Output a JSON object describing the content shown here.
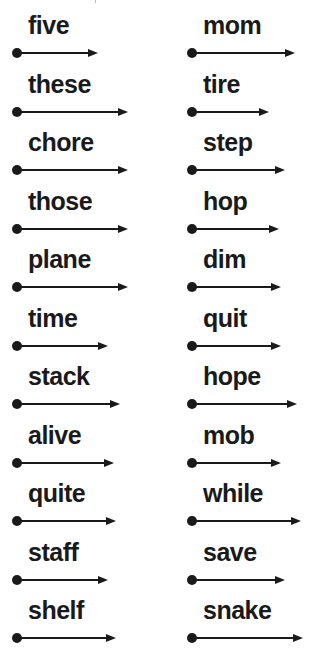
{
  "page": {
    "background": "#ffffff",
    "ink": "#1a1a1a"
  },
  "columns": [
    {
      "x": 12,
      "words": [
        {
          "text": "five",
          "arrow": 86
        },
        {
          "text": "these",
          "arrow": 116
        },
        {
          "text": "chore",
          "arrow": 116
        },
        {
          "text": "those",
          "arrow": 116
        },
        {
          "text": "plane",
          "arrow": 116
        },
        {
          "text": "time",
          "arrow": 96
        },
        {
          "text": "stack",
          "arrow": 108
        },
        {
          "text": "alive",
          "arrow": 102
        },
        {
          "text": "quite",
          "arrow": 104
        },
        {
          "text": "staff",
          "arrow": 96
        },
        {
          "text": "shelf",
          "arrow": 104
        }
      ]
    },
    {
      "x": 187,
      "words": [
        {
          "text": "mom",
          "arrow": 108
        },
        {
          "text": "tire",
          "arrow": 82
        },
        {
          "text": "step",
          "arrow": 98
        },
        {
          "text": "hop",
          "arrow": 92
        },
        {
          "text": "dim",
          "arrow": 94
        },
        {
          "text": "quit",
          "arrow": 94
        },
        {
          "text": "hope",
          "arrow": 110
        },
        {
          "text": "mob",
          "arrow": 94
        },
        {
          "text": "while",
          "arrow": 114
        },
        {
          "text": "save",
          "arrow": 98
        },
        {
          "text": "snake",
          "arrow": 116
        }
      ]
    }
  ]
}
